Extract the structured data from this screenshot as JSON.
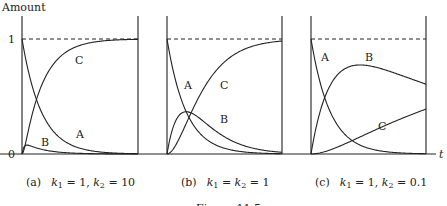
{
  "figure": {
    "y_axis_label": "Amount",
    "x_axis_label": "t",
    "y_tick_top": "1",
    "y_tick_bottom": "0",
    "figure_caption": "Figure 11.5"
  },
  "chart_data": [
    {
      "type": "line",
      "panel": "(a)",
      "title": "(a)  k1 = 1, k2 = 10",
      "params": {
        "k1": 1,
        "k2": 10
      },
      "xlabel": "t",
      "ylabel": "Amount",
      "ylim": [
        0,
        1
      ],
      "reference_line": {
        "y": 1,
        "style": "dashed"
      },
      "x": [
        0,
        0.5,
        1,
        1.5,
        2,
        3,
        4,
        5,
        6
      ],
      "series": [
        {
          "name": "A",
          "values": [
            1.0,
            0.61,
            0.37,
            0.22,
            0.14,
            0.05,
            0.02,
            0.01,
            0.0
          ]
        },
        {
          "name": "B",
          "values": [
            0.0,
            0.06,
            0.04,
            0.02,
            0.015,
            0.005,
            0.002,
            0.0,
            0.0
          ]
        },
        {
          "name": "C",
          "values": [
            0.0,
            0.33,
            0.59,
            0.76,
            0.85,
            0.945,
            0.98,
            0.99,
            1.0
          ]
        }
      ]
    },
    {
      "type": "line",
      "panel": "(b)",
      "title": "(b)  k1 = k2 = 1",
      "params": {
        "k1": 1,
        "k2": 1
      },
      "xlabel": "t",
      "ylabel": "Amount",
      "ylim": [
        0,
        1
      ],
      "reference_line": {
        "y": 1,
        "style": "dashed"
      },
      "x": [
        0,
        0.5,
        1,
        1.5,
        2,
        3,
        4,
        5,
        6
      ],
      "series": [
        {
          "name": "A",
          "values": [
            1.0,
            0.61,
            0.37,
            0.22,
            0.14,
            0.05,
            0.02,
            0.01,
            0.0
          ]
        },
        {
          "name": "B",
          "values": [
            0.0,
            0.3,
            0.37,
            0.33,
            0.27,
            0.15,
            0.07,
            0.03,
            0.015
          ]
        },
        {
          "name": "C",
          "values": [
            0.0,
            0.09,
            0.26,
            0.44,
            0.59,
            0.8,
            0.91,
            0.96,
            0.98
          ]
        }
      ]
    },
    {
      "type": "line",
      "panel": "(c)",
      "title": "(c)  k1 = 1, k2 = 0.1",
      "params": {
        "k1": 1,
        "k2": 0.1
      },
      "xlabel": "t",
      "ylabel": "Amount",
      "ylim": [
        0,
        1
      ],
      "reference_line": {
        "y": 1,
        "style": "dashed"
      },
      "x": [
        0,
        0.5,
        1,
        1.5,
        2,
        3,
        4,
        5,
        6
      ],
      "series": [
        {
          "name": "A",
          "values": [
            1.0,
            0.61,
            0.37,
            0.22,
            0.14,
            0.05,
            0.02,
            0.01,
            0.0
          ]
        },
        {
          "name": "B",
          "values": [
            0.0,
            0.37,
            0.58,
            0.69,
            0.75,
            0.78,
            0.76,
            0.72,
            0.68
          ]
        },
        {
          "name": "C",
          "values": [
            0.0,
            0.01,
            0.04,
            0.08,
            0.11,
            0.17,
            0.22,
            0.27,
            0.32
          ]
        }
      ]
    }
  ],
  "panels": [
    {
      "letter": "(a)",
      "k1": "1",
      "k2": "10",
      "curve_labels": [
        "A",
        "B",
        "C"
      ]
    },
    {
      "letter": "(b)",
      "k1k2": "1",
      "curve_labels": [
        "A",
        "B",
        "C"
      ]
    },
    {
      "letter": "(c)",
      "k1": "1",
      "k2": "0.1",
      "curve_labels": [
        "A",
        "B",
        "C"
      ]
    }
  ]
}
